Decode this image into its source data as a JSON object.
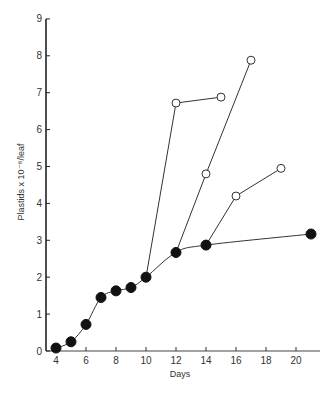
{
  "chart_data": {
    "type": "line",
    "title": "",
    "xlabel": "Days",
    "ylabel": "Plastids x 10⁻⁸/leaf",
    "xlim": [
      3.3,
      21.6
    ],
    "ylim": [
      0,
      9
    ],
    "x_ticks": [
      4,
      6,
      8,
      10,
      12,
      14,
      16,
      18,
      20
    ],
    "y_ticks": [
      0,
      1,
      2,
      3,
      4,
      5,
      6,
      7,
      8,
      9
    ],
    "grid": false,
    "legend": null,
    "series": [
      {
        "name": "control (filled circles)",
        "marker": "filled-circle",
        "smooth": true,
        "x": [
          4,
          5,
          6,
          7,
          8,
          9,
          10,
          12,
          14,
          21
        ],
        "y": [
          0.08,
          0.25,
          0.72,
          1.45,
          1.63,
          1.72,
          2.0,
          2.67,
          2.87,
          3.17
        ]
      },
      {
        "name": "branch from day 10 (open circles)",
        "marker": "open-circle",
        "smooth": false,
        "x": [
          10,
          12,
          15
        ],
        "y": [
          2.0,
          6.72,
          6.88
        ]
      },
      {
        "name": "branch from day 12 (open circles)",
        "marker": "open-circle",
        "smooth": false,
        "x": [
          12,
          14,
          17
        ],
        "y": [
          2.67,
          4.8,
          7.88
        ]
      },
      {
        "name": "branch from day 14 (open circles)",
        "marker": "open-circle",
        "smooth": false,
        "x": [
          14,
          16,
          19
        ],
        "y": [
          2.87,
          4.2,
          4.95
        ]
      }
    ]
  }
}
